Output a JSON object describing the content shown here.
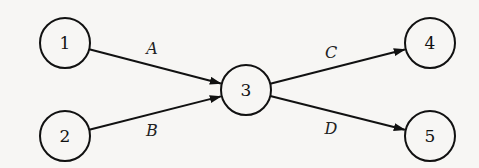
{
  "diagram": {
    "type": "directed-graph",
    "colors": {
      "stroke": "#111111",
      "background": "#f7f6f4"
    },
    "nodes": [
      {
        "id": "1",
        "label": "1",
        "cx": 65,
        "cy": 43,
        "r": 25
      },
      {
        "id": "2",
        "label": "2",
        "cx": 65,
        "cy": 136,
        "r": 25
      },
      {
        "id": "3",
        "label": "3",
        "cx": 246,
        "cy": 90,
        "r": 25
      },
      {
        "id": "4",
        "label": "4",
        "cx": 430,
        "cy": 43,
        "r": 25
      },
      {
        "id": "5",
        "label": "5",
        "cx": 430,
        "cy": 136,
        "r": 25
      }
    ],
    "edges": [
      {
        "from": "1",
        "to": "3",
        "label": "A",
        "lx": 152,
        "ly": 48
      },
      {
        "from": "2",
        "to": "3",
        "label": "B",
        "lx": 152,
        "ly": 130
      },
      {
        "from": "3",
        "to": "4",
        "label": "C",
        "lx": 331,
        "ly": 52
      },
      {
        "from": "3",
        "to": "5",
        "label": "D",
        "lx": 331,
        "ly": 128
      }
    ]
  }
}
